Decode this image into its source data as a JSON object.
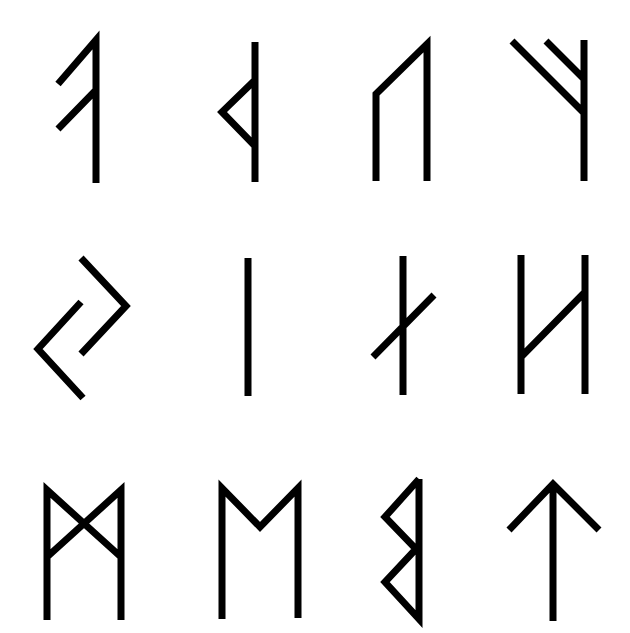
{
  "canvas": {
    "width": 630,
    "height": 633,
    "background": "#ffffff"
  },
  "style": {
    "stroke": "#000000",
    "stroke_width": 7
  },
  "grid": {
    "rows": 3,
    "columns": 4
  },
  "runes": [
    {
      "name": "rune-ansuz",
      "row": 1,
      "col": 1,
      "d": "M96 183 L96 40 L58 84 M96 90 L58 129"
    },
    {
      "name": "rune-thurisaz",
      "row": 1,
      "col": 2,
      "d": "M255 42 L255 182 M255 80 L222 112 L255 146"
    },
    {
      "name": "rune-uruz",
      "row": 1,
      "col": 3,
      "d": "M376 181 L376 94 L427 44 L427 181"
    },
    {
      "name": "rune-fehu",
      "row": 1,
      "col": 4,
      "d": "M584 40 L584 181 M512 41 L584 113 M546 41 L584 79"
    },
    {
      "name": "rune-jera",
      "row": 2,
      "col": 1,
      "d": "M81 302 L38 349 L83 398 M81 258 L126 306 L81 354"
    },
    {
      "name": "rune-isa",
      "row": 2,
      "col": 2,
      "d": "M248 258 L248 396"
    },
    {
      "name": "rune-nauthiz",
      "row": 2,
      "col": 3,
      "d": "M403 256 L403 395 M373 357 L434 295"
    },
    {
      "name": "rune-hagalaz",
      "row": 2,
      "col": 4,
      "d": "M521 255 L521 394 M585 255 L585 394 M521 357 L585 292"
    },
    {
      "name": "rune-dagaz",
      "row": 3,
      "col": 1,
      "d": "M47 620 L47 490 L121 557 M121 620 L121 490 L47 557"
    },
    {
      "name": "rune-mannaz",
      "row": 3,
      "col": 2,
      "d": "M222 619 L222 488 L260 527 L298 488 L298 618"
    },
    {
      "name": "rune-berkanan",
      "row": 3,
      "col": 3,
      "d": "M419 479 L419 619 L385 582 L416 549 L385 517 L419 479"
    },
    {
      "name": "rune-tiwaz",
      "row": 3,
      "col": 4,
      "d": "M553 621 L553 484 M509 530 L553 484 L599 530"
    }
  ]
}
